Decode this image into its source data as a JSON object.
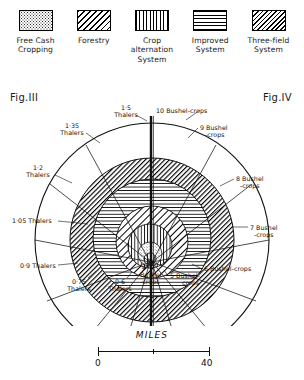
{
  "legend": {
    "items": [
      {
        "label": "Free Cash\nCropping",
        "pattern": "stipple",
        "name": "free-cash-cropping"
      },
      {
        "label": "Forestry",
        "pattern": "diag-wide",
        "name": "forestry"
      },
      {
        "label": "Crop\nalternation\nSystem",
        "pattern": "vert",
        "name": "crop-alternation-system"
      },
      {
        "label": "Improved\nSystem",
        "pattern": "horz",
        "name": "improved-system"
      },
      {
        "label": "Three-field\nSystem",
        "pattern": "diag-dense",
        "name": "three-field-system"
      }
    ]
  },
  "figures": {
    "left_label": "Fig.III",
    "right_label": "Fig.IV"
  },
  "scale": {
    "title": "MILES",
    "min": "0",
    "max": "40"
  },
  "chart_data": {
    "type": "pie",
    "xlabel": "",
    "ylabel": "",
    "legend_position": "top",
    "grid": false,
    "left_panel": {
      "figure": "Fig.III",
      "unit": "Thalers",
      "description": "Land rent gradient, outward from centre",
      "ring_labels": [
        "1·5 Thalers",
        "1·35 Thalers",
        "1·2 Thalers",
        "1·05 Thalers",
        "0·9 Thalers",
        "0·75 Thalers",
        "0·6 Thalers"
      ],
      "values": [
        1.5,
        1.35,
        1.2,
        1.05,
        0.9,
        0.75,
        0.6
      ]
    },
    "right_panel": {
      "figure": "Fig.IV",
      "unit": "Bushel-crops",
      "description": "Crop yield gradient, outward from centre",
      "ring_labels": [
        "10 Bushel-crops",
        "9 Bushel-crops",
        "8 Bushel-crops",
        "7 Bushel-crops",
        "6 Bushel-crops",
        "5 Bushel-crops",
        "4 Bushel-crops"
      ],
      "values": [
        10,
        9,
        8,
        7,
        6,
        5,
        4
      ]
    },
    "zones": [
      {
        "name": "Free Cash Cropping",
        "pattern": "stipple"
      },
      {
        "name": "Forestry",
        "pattern": "diag-wide"
      },
      {
        "name": "Crop alternation System",
        "pattern": "vert"
      },
      {
        "name": "Improved System",
        "pattern": "horz"
      },
      {
        "name": "Three-field System",
        "pattern": "diag-dense"
      }
    ],
    "scale_bar": {
      "label": "MILES",
      "ticks": [
        0,
        40
      ]
    }
  },
  "labels": {
    "l1": "1·5",
    "l1b": "Thalers",
    "l2": "1·35",
    "l2b": "Thalers",
    "l3": "1·2",
    "l3b": "Thalers",
    "l4": "1·05 Thalers",
    "l5": "0·9 Thalers",
    "l6": "0·75",
    "l6b": "Thalers",
    "l7": "0·6",
    "l7b": "Thalers",
    "r1": "10 Bushel-crops",
    "r2": "9 Bushel",
    "r2b": "-crops",
    "r3": "8 Bushel",
    "r3b": "-crops",
    "r4": "7 Bushel",
    "r4b": "-crops",
    "r5": "6 Bushel-crops",
    "r6": "5 Bushel-",
    "r6b": "crops",
    "r7": "4",
    "r7b": "Bushel",
    "r7c": "-crops"
  }
}
